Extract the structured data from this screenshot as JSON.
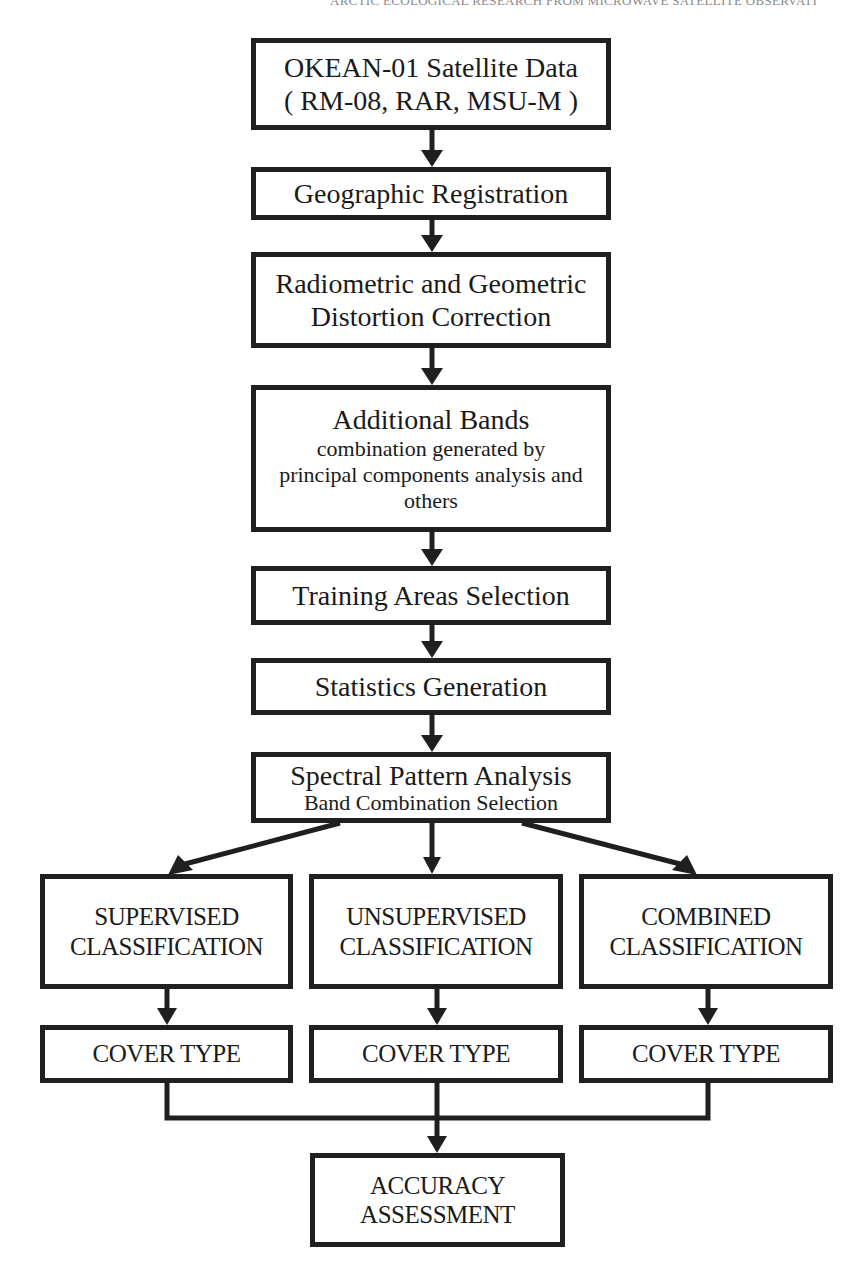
{
  "header": {
    "running_title": "ARCTIC ECOLOGICAL RESEARCH FROM MICROWAVE SATELLITE OBSERVATI"
  },
  "flowchart": {
    "steps": [
      {
        "id": "okean",
        "line1": "OKEAN-01 Satellite Data",
        "line2": "( RM-08, RAR, MSU-M )"
      },
      {
        "id": "geo-reg",
        "line1": "Geographic Registration"
      },
      {
        "id": "distortion",
        "line1": "Radiometric and Geometric",
        "line2": "Distortion Correction"
      },
      {
        "id": "additional-bands",
        "line1": "Additional Bands",
        "line2": "combination generated by",
        "line3": "principal components analysis and",
        "line4": "others"
      },
      {
        "id": "training",
        "line1": "Training Areas Selection"
      },
      {
        "id": "statistics",
        "line1": "Statistics Generation"
      },
      {
        "id": "spectral",
        "line1": "Spectral Pattern Analysis",
        "line2": "Band Combination Selection"
      }
    ],
    "branches": [
      {
        "id": "supervised",
        "line1": "SUPERVISED",
        "line2": "CLASSIFICATION",
        "output": "COVER TYPE"
      },
      {
        "id": "unsupervised",
        "line1": "UNSUPERVISED",
        "line2": "CLASSIFICATION",
        "output": "COVER TYPE"
      },
      {
        "id": "combined",
        "line1": "COMBINED",
        "line2": "CLASSIFICATION",
        "output": "COVER TYPE"
      }
    ],
    "final": {
      "id": "accuracy",
      "line1": "ACCURACY",
      "line2": "ASSESSMENT"
    },
    "colors": {
      "stroke": "#1f1f1f",
      "background": "#ffffff",
      "text": "#1a1a1a"
    }
  }
}
